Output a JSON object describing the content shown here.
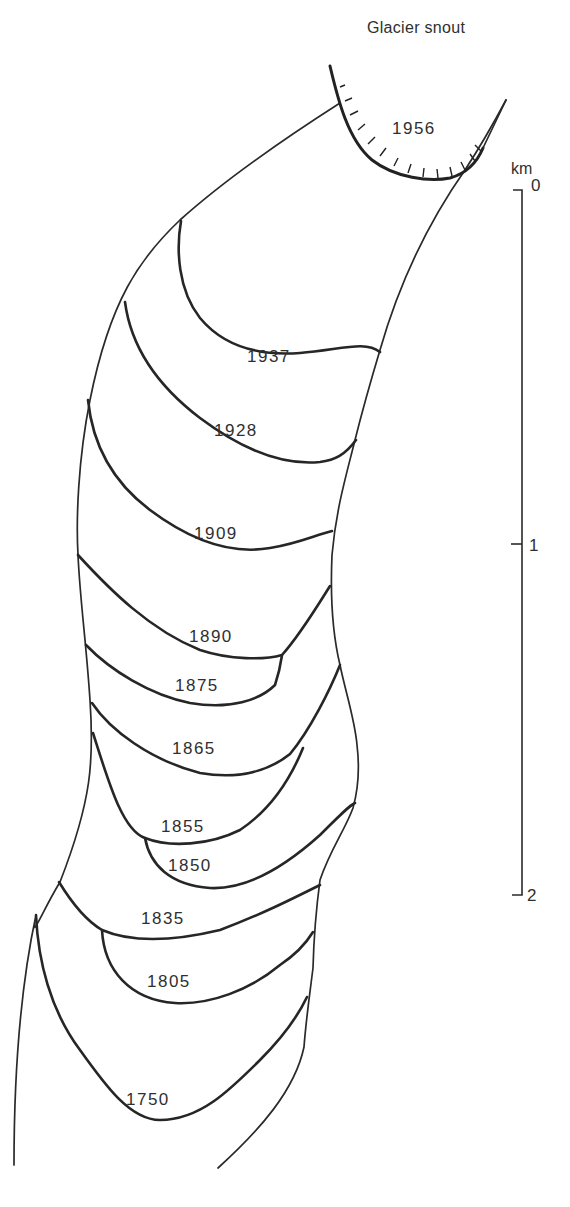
{
  "diagram": {
    "title": "Glacier snout",
    "type": "glacier retreat map",
    "current_snout_year": "1956",
    "moraine_positions": [
      {
        "year": "1956",
        "note": "current glacier snout (hachured)"
      },
      {
        "year": "1937"
      },
      {
        "year": "1928"
      },
      {
        "year": "1909"
      },
      {
        "year": "1890"
      },
      {
        "year": "1875"
      },
      {
        "year": "1865"
      },
      {
        "year": "1855"
      },
      {
        "year": "1850"
      },
      {
        "year": "1835"
      },
      {
        "year": "1805"
      },
      {
        "year": "1750"
      }
    ],
    "labels": {
      "y1956": "1956",
      "y1937": "1937",
      "y1928": "1928",
      "y1909": "1909",
      "y1890": "1890",
      "y1875": "1875",
      "y1865": "1865",
      "y1855": "1855",
      "y1850": "1850",
      "y1835": "1835",
      "y1805": "1805",
      "y1750": "1750"
    },
    "scale": {
      "unit": "km",
      "ticks": [
        "0",
        "1",
        "2"
      ]
    },
    "colors": {
      "line": "#2a2a2a",
      "background": "#ffffff"
    }
  }
}
